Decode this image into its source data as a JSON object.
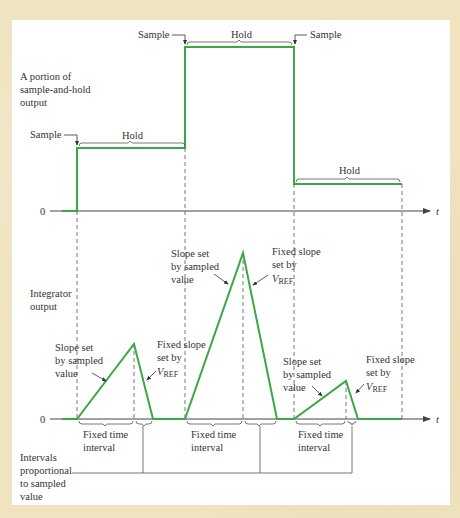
{
  "diagram": {
    "type": "timing-diagram",
    "colors": {
      "waveform": "#3aa845",
      "axis": "#444444",
      "dashed": "#555555",
      "text": "#333333",
      "background": "#efe3c0",
      "panel": "#ffffff"
    },
    "top_panel": {
      "title_lines": [
        "A portion of",
        "sample-and-hold",
        "output"
      ],
      "zero_label": "0",
      "axis_label": "t",
      "sample_labels": [
        "Sample",
        "Sample",
        "Sample"
      ],
      "hold_labels": [
        "Hold",
        "Hold",
        "Hold"
      ]
    },
    "bottom_panel": {
      "title_lines": [
        "Integrator",
        "output"
      ],
      "zero_label": "0",
      "axis_label": "t",
      "ramp_up_label_lines": [
        "Slope set",
        "by sampled",
        "value"
      ],
      "ramp_down_label_lines": [
        "Fixed slope",
        "set by"
      ],
      "vref_label": "V",
      "vref_subscript": "REF",
      "fixed_interval_label_lines": [
        "Fixed time",
        "interval"
      ],
      "proportional_label_lines": [
        "Intervals",
        "proportional",
        "to sampled",
        "value"
      ]
    }
  }
}
